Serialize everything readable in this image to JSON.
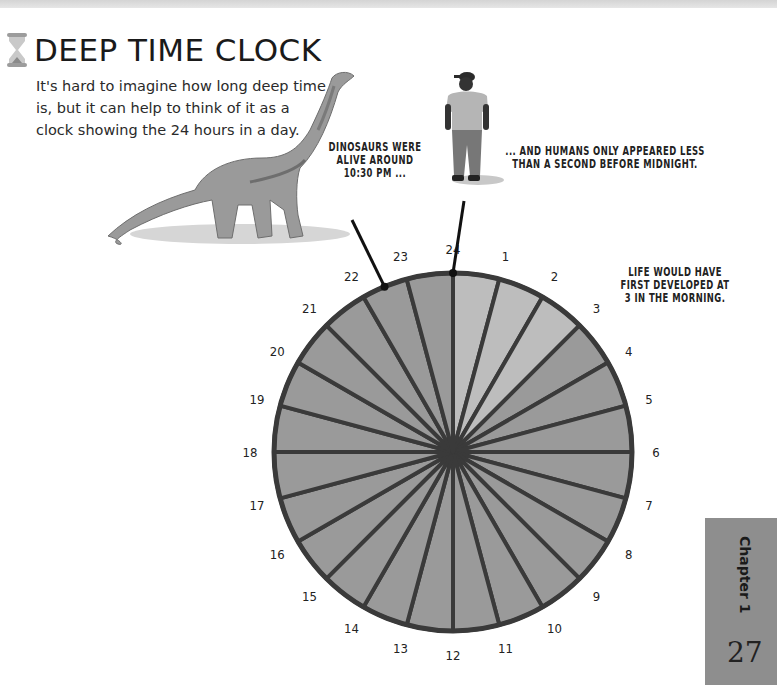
{
  "page": {
    "title": "DEEP TIME CLOCK",
    "intro": "It's hard to imagine how long deep time is, but it can help to think of it as a clock showing the 24 hours in a day.",
    "captions": {
      "dinosaurs": [
        "DINOSAURS WERE",
        "ALIVE AROUND",
        "10:30 PM ..."
      ],
      "humans": [
        "... AND HUMANS ONLY APPEARED LESS",
        "THAN A SECOND BEFORE MIDNIGHT."
      ],
      "life": [
        "LIFE WOULD HAVE",
        "FIRST DEVELOPED AT",
        "3 IN THE MORNING."
      ]
    },
    "chapter_label": "Chapter 1",
    "page_number": "27",
    "icons": {
      "title_icon": "hourglass-icon",
      "dinosaur": "sauropod-illustration",
      "human": "person-illustration"
    }
  },
  "chart_data": {
    "type": "pie",
    "title": "Deep Time Clock",
    "segments": 24,
    "hour_labels": [
      "24",
      "1",
      "2",
      "3",
      "4",
      "5",
      "6",
      "7",
      "8",
      "9",
      "10",
      "11",
      "12",
      "13",
      "14",
      "15",
      "16",
      "17",
      "18",
      "19",
      "20",
      "21",
      "22",
      "23"
    ],
    "highlighted_hours": [
      0,
      1,
      2
    ],
    "highlight_meaning": "Life first developed at 3 in the morning (segments before 3 shaded lighter)",
    "markers": [
      {
        "label": "Dinosaurs",
        "hour": 22.5
      },
      {
        "label": "Humans",
        "hour": 24
      }
    ],
    "colors": {
      "early_segment": "#bdbdbd",
      "segment": "#9a9a9a",
      "outline": "#3a3a3a"
    }
  }
}
